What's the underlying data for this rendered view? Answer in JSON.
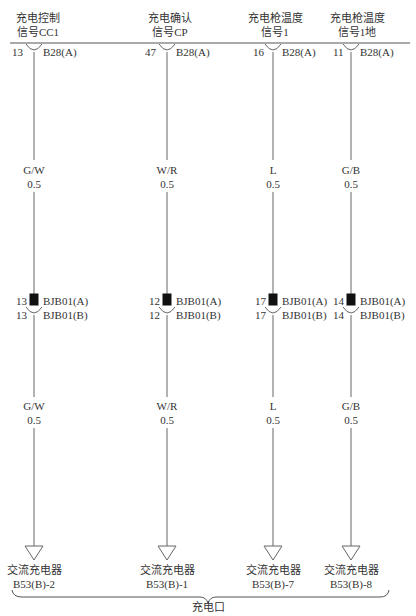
{
  "diagram": {
    "bottom_group_label": "充电口",
    "circuits": [
      {
        "title_line1": "充电控制",
        "title_line2": "信号CC1",
        "top_pin": "13",
        "top_connector": "B28(A)",
        "wire_upper_color": "G/W",
        "wire_upper_size": "0.5",
        "mid_pin_a": "13",
        "mid_connector_a": "BJB01(A)",
        "mid_pin_b": "13",
        "mid_connector_b": "BJB01(B)",
        "wire_lower_color": "G/W",
        "wire_lower_size": "0.5",
        "end_device": "交流充电器",
        "end_pin": "B53(B)-2"
      },
      {
        "title_line1": "充电确认",
        "title_line2": "信号CP",
        "top_pin": "47",
        "top_connector": "B28(A)",
        "wire_upper_color": "W/R",
        "wire_upper_size": "0.5",
        "mid_pin_a": "12",
        "mid_connector_a": "BJB01(A)",
        "mid_pin_b": "12",
        "mid_connector_b": "BJB01(B)",
        "wire_lower_color": "W/R",
        "wire_lower_size": "0.5",
        "end_device": "交流充电器",
        "end_pin": "B53(B)-1"
      },
      {
        "title_line1": "充电枪温度",
        "title_line2": "信号1",
        "top_pin": "16",
        "top_connector": "B28(A)",
        "wire_upper_color": "L",
        "wire_upper_size": "0.5",
        "mid_pin_a": "17",
        "mid_connector_a": "BJB01(A)",
        "mid_pin_b": "17",
        "mid_connector_b": "BJB01(B)",
        "wire_lower_color": "L",
        "wire_lower_size": "0.5",
        "end_device": "交流充电器",
        "end_pin": "B53(B)-7"
      },
      {
        "title_line1": "充电枪温度",
        "title_line2": "信号1地",
        "top_pin": "11",
        "top_connector": "B28(A)",
        "wire_upper_color": "G/B",
        "wire_upper_size": "0.5",
        "mid_pin_a": "14",
        "mid_connector_a": "BJB01(A)",
        "mid_pin_b": "14",
        "mid_connector_b": "BJB01(B)",
        "wire_lower_color": "G/B",
        "wire_lower_size": "0.5",
        "end_device": "交流充电器",
        "end_pin": "B53(B)-8"
      }
    ]
  }
}
